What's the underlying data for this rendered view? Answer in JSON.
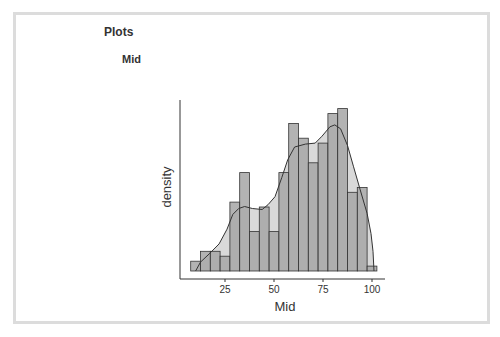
{
  "page": {
    "section_title": "Plots",
    "plot_title": "Mid"
  },
  "colors": {
    "frame_border": "#dcdcdc",
    "bar_fill": "#a6a6a6",
    "bar_stroke": "#333333",
    "density_fill": "#d9d9d9",
    "density_line": "#333333",
    "axis": "#333333",
    "text": "#333333"
  },
  "chart_data": {
    "type": "bar",
    "subtype": "histogram_with_density",
    "title": "Mid",
    "xlabel": "Mid",
    "ylabel": "density",
    "x_ticks": [
      25,
      50,
      75,
      100
    ],
    "y_ticks": [],
    "xlim": [
      0,
      105
    ],
    "grid": false,
    "legend": null,
    "bin_width": 5,
    "bins": [
      {
        "x0": 7.5,
        "x1": 12.5,
        "count": 2
      },
      {
        "x0": 12.5,
        "x1": 17.5,
        "count": 4
      },
      {
        "x0": 17.5,
        "x1": 22.5,
        "count": 4
      },
      {
        "x0": 22.5,
        "x1": 27.5,
        "count": 3
      },
      {
        "x0": 27.5,
        "x1": 32.5,
        "count": 14
      },
      {
        "x0": 32.5,
        "x1": 37.5,
        "count": 20
      },
      {
        "x0": 37.5,
        "x1": 42.5,
        "count": 8
      },
      {
        "x0": 42.5,
        "x1": 47.5,
        "count": 13
      },
      {
        "x0": 47.5,
        "x1": 52.5,
        "count": 8
      },
      {
        "x0": 52.5,
        "x1": 57.5,
        "count": 20
      },
      {
        "x0": 57.5,
        "x1": 62.5,
        "count": 30
      },
      {
        "x0": 62.5,
        "x1": 67.5,
        "count": 27
      },
      {
        "x0": 67.5,
        "x1": 72.5,
        "count": 22
      },
      {
        "x0": 72.5,
        "x1": 77.5,
        "count": 26
      },
      {
        "x0": 77.5,
        "x1": 82.5,
        "count": 32
      },
      {
        "x0": 82.5,
        "x1": 87.5,
        "count": 33
      },
      {
        "x0": 87.5,
        "x1": 92.5,
        "count": 16
      },
      {
        "x0": 92.5,
        "x1": 97.5,
        "count": 17
      },
      {
        "x0": 97.5,
        "x1": 102.5,
        "count": 1
      }
    ],
    "density_curve": {
      "x": [
        10,
        12.5,
        17,
        22,
        26,
        29,
        32,
        35,
        39,
        44,
        47,
        50.5,
        54,
        57,
        60.5,
        66,
        71,
        74.5,
        78.5,
        81,
        84,
        87.5,
        90.5,
        94,
        97.5,
        99.5,
        100.5,
        101
      ],
      "count": [
        0,
        1.8,
        3.5,
        5.5,
        8.5,
        11.5,
        12.7,
        13.1,
        12.7,
        12.5,
        13.5,
        15.1,
        19,
        22.6,
        25.2,
        25.8,
        26,
        27.4,
        29.3,
        29.7,
        28.9,
        25.5,
        21.3,
        16.5,
        11.7,
        7.6,
        4,
        0
      ]
    },
    "layout_px": {
      "x0_px": 176.0,
      "px_per_unit": 1.96,
      "baseline_px": 271,
      "px_per_count": 4.92,
      "x_axis_y": 279,
      "x_axis_from": 180,
      "x_axis_to": 385,
      "y_axis_x": 180,
      "y_axis_from": 100,
      "y_axis_to": 279
    }
  }
}
